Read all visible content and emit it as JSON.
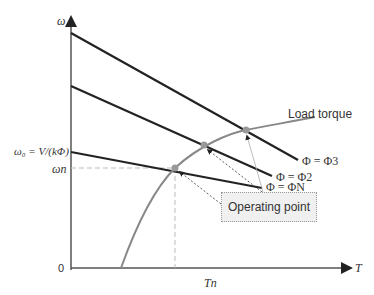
{
  "diagram": {
    "axes": {
      "y_label": "ω",
      "x_label": "T",
      "origin": "0"
    },
    "y_ticks": {
      "omega_0": "ω₀ = V/(kΦ)",
      "omega_n": "ωn"
    },
    "x_ticks": {
      "T_n": "Tn"
    },
    "curves": {
      "load_torque": "Load torque",
      "phi3": "Φ = Φ3",
      "phi2": "Φ = Φ2",
      "phiN": "Φ = ΦN"
    },
    "annotation": "Operating point"
  }
}
